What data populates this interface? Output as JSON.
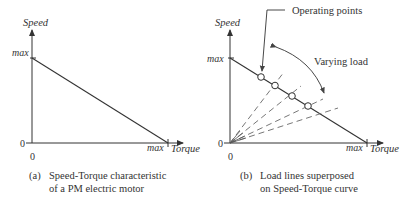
{
  "figure": {
    "panel_a": {
      "y_axis_label": "Speed",
      "x_axis_label": "Torque",
      "y_max_label": "max",
      "x_max_label": "max",
      "y_zero_label": "0",
      "x_zero_label": "0",
      "caption_tag": "(a)",
      "caption_line1": "Speed-Torque characteristic",
      "caption_line2": "of a PM electric motor"
    },
    "panel_b": {
      "y_axis_label": "Speed",
      "x_axis_label": "Torque",
      "y_max_label": "max",
      "x_max_label": "max",
      "y_zero_label": "0",
      "x_zero_label": "0",
      "operating_points_label": "Operating points",
      "varying_load_label": "Varying load",
      "caption_tag": "(b)",
      "caption_line1": "Load lines superposed",
      "caption_line2": "on Speed-Torque curve",
      "operating_point_count": 4
    },
    "colors": {
      "ink": "#333333",
      "dashed": "#888888",
      "background": "#ffffff"
    }
  }
}
